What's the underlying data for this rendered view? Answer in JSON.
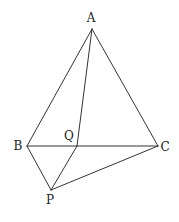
{
  "diagram": {
    "type": "geometry",
    "colors": {
      "line": "#333333",
      "label": "#222222",
      "background": "#ffffff"
    },
    "points": {
      "A": {
        "label": "A",
        "x": 92,
        "y": 29,
        "lx": 91,
        "ly": 22
      },
      "B": {
        "label": "B",
        "x": 27,
        "y": 146,
        "lx": 18,
        "ly": 150
      },
      "Q": {
        "label": "Q",
        "x": 77,
        "y": 146,
        "lx": 69,
        "ly": 140
      },
      "C": {
        "label": "C",
        "x": 158,
        "y": 146,
        "lx": 165,
        "ly": 151
      },
      "P": {
        "label": "P",
        "x": 51,
        "y": 190,
        "lx": 50,
        "ly": 204
      }
    },
    "segments": [
      [
        "A",
        "B"
      ],
      [
        "A",
        "C"
      ],
      [
        "A",
        "Q"
      ],
      [
        "B",
        "C"
      ],
      [
        "B",
        "P"
      ],
      [
        "P",
        "Q"
      ],
      [
        "P",
        "C"
      ]
    ]
  }
}
